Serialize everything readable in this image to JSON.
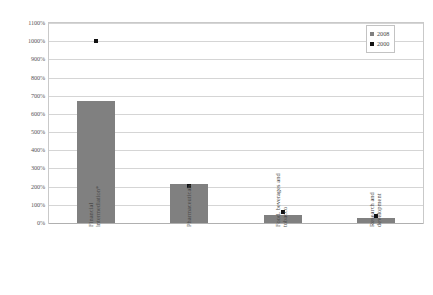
{
  "chart_data": {
    "type": "bar",
    "title": "",
    "subtitle": "",
    "xlabel": "",
    "ylabel": "Outward sectoral R&D intensity",
    "categories": [
      "Financial intermediation*",
      "Pharmaceuticals",
      "Food, beverages and tobacco",
      "Research and development"
    ],
    "category_lines": [
      [
        "Financial",
        "intermediation*"
      ],
      [
        "Pharmaceuticals"
      ],
      [
        "Food, beverages and",
        "tobacco"
      ],
      [
        "Research and",
        "development"
      ]
    ],
    "series": [
      {
        "name": "2008",
        "render": "bar",
        "color": "#808080",
        "values": [
          670,
          215,
          45,
          28
        ]
      },
      {
        "name": "2000",
        "render": "marker",
        "color": "#111111",
        "values": [
          1000,
          205,
          62,
          38
        ]
      }
    ],
    "ylim": [
      0,
      1100
    ],
    "ytick_step": 100,
    "ytick_labels": [
      "0%",
      "100%",
      "200%",
      "300%",
      "400%",
      "500%",
      "600%",
      "700%",
      "800%",
      "900%",
      "1000%",
      "1100%"
    ],
    "ytick_values": [
      0,
      100,
      200,
      300,
      400,
      500,
      600,
      700,
      800,
      900,
      1000,
      1100
    ],
    "grid": true,
    "legend_position": "top-right",
    "legend_entries": [
      {
        "label": "2008",
        "color": "#808080"
      },
      {
        "label": "2000",
        "color": "#111111"
      }
    ]
  }
}
